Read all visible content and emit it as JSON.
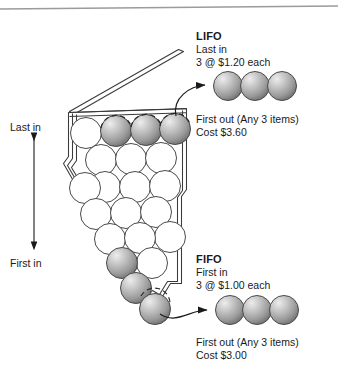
{
  "diagram": {
    "title_icon": "inventory-bin-icon",
    "background_color": "#ffffff",
    "ink_color": "#1a1a1a",
    "ball_gray_light": "#e8e8e8",
    "ball_gray_mid": "#a8a8a8",
    "ball_gray_dark": "#6e6e6e",
    "ball_white": "#ffffff"
  },
  "axis": {
    "top_label": "Last in",
    "bottom_label": "First in",
    "arrow_name": "double-headed-vertical-arrow"
  },
  "lifo": {
    "title": "LIFO",
    "in_label": "Last in",
    "unit_cost_line": "3 @ $1.20 each",
    "out_label": "First out (Any 3 items)",
    "cost_line": "Cost $3.60",
    "out_ball_count": 3,
    "arrow_name": "lifo-flow-arrow"
  },
  "fifo": {
    "title": "FIFO",
    "in_label": "First in",
    "unit_cost_line": "3 @ $1.00 each",
    "out_label": "First out (Any 3 items)",
    "cost_line": "Cost $3.00",
    "out_ball_count": 3,
    "arrow_name": "fifo-flow-arrow"
  },
  "bin": {
    "name": "inventory-bin",
    "lid_state": "open",
    "total_items_visible": 25,
    "highlighted_top_items": 3,
    "highlighted_bottom_items": 3
  }
}
